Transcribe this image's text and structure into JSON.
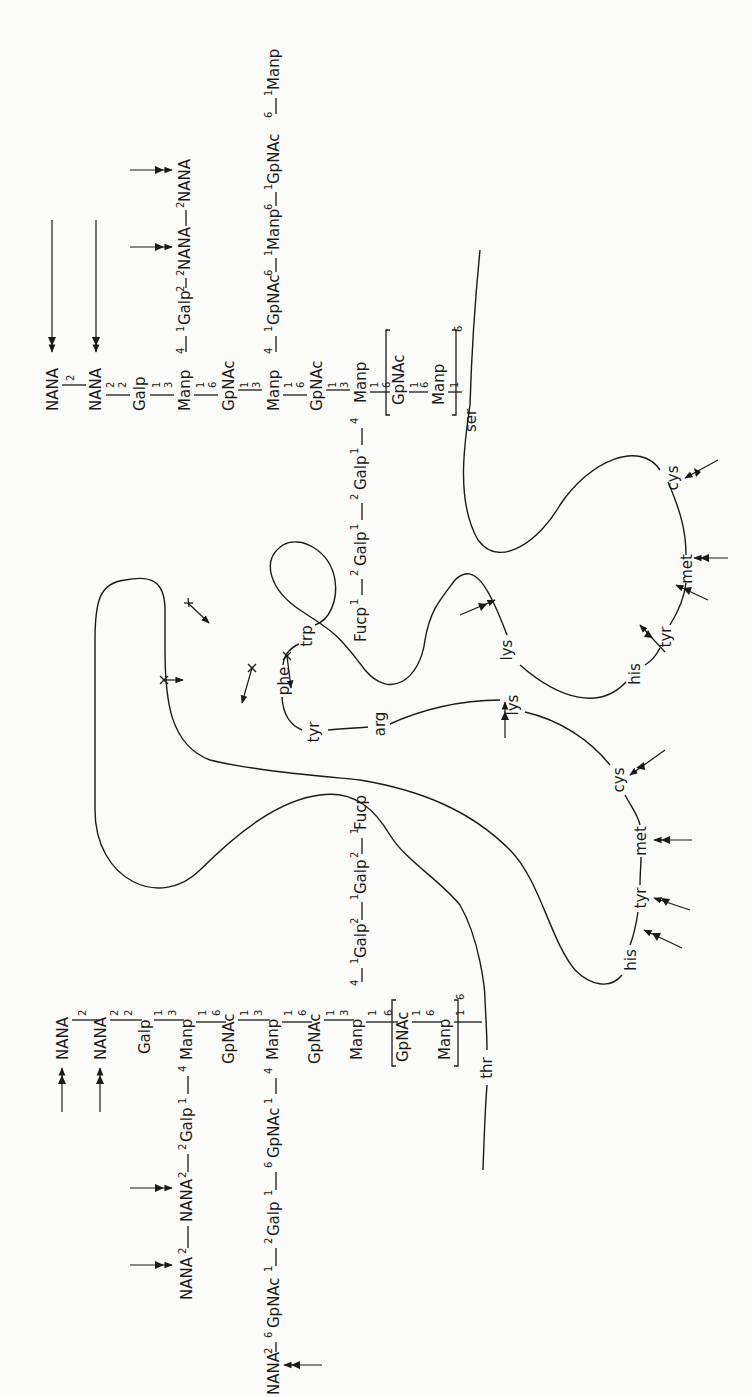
{
  "figure": {
    "orientation": "rotated-90-ccw"
  },
  "glycan_upper": {
    "attachment_residue": "ser",
    "trunk": [
      {
        "sugar": "NANA",
        "link_below": "2"
      },
      {
        "sugar": "NANA",
        "link_above": "2",
        "link_below": "2"
      },
      {
        "sugar": "Galp",
        "link_above": "2",
        "link_below": "1"
      },
      {
        "sugar": "Manp",
        "link_above": "3",
        "link_below": "1",
        "branch_pos": "4"
      },
      {
        "sugar": "GpNAc",
        "link_above": "6",
        "link_below": "1"
      },
      {
        "sugar": "Manp",
        "link_above": "3",
        "link_below": "1",
        "branch_pos": "4"
      },
      {
        "sugar": "GpNAc",
        "link_above": "6",
        "link_below": "1"
      },
      {
        "sugar": "Manp",
        "link_above": "3",
        "link_below": "1",
        "branch_pos": "4"
      },
      {
        "sugar": "GpNAc",
        "link_above": "6",
        "link_below": "1",
        "bracketed": true
      },
      {
        "sugar": "Manp",
        "link_above": "6",
        "link_below": "1",
        "bracketed": true
      },
      {
        "sugar": "ser"
      }
    ],
    "bracket_repeat": "6",
    "branches": [
      {
        "from": "Manp (1st)",
        "chain": [
          "1",
          "Galp",
          "2",
          "2",
          "NANA",
          "2",
          "NANA"
        ],
        "labels": [
          "Galp",
          "NANA",
          "NANA"
        ],
        "links": [
          "1",
          "2",
          "2",
          "2"
        ]
      },
      {
        "from": "Manp (2nd)",
        "chain": [
          "GpNAc",
          "Manp",
          "GpNAc",
          "Manp"
        ],
        "labels": [
          "GpNAc",
          "Manp",
          "GpNAc",
          "Manp"
        ],
        "links": [
          "1",
          "6",
          "1",
          "6",
          "1",
          "6",
          "1"
        ]
      },
      {
        "from": "Manp (3rd)",
        "chain": [
          "Galp",
          "Galp",
          "Fucp"
        ],
        "labels": [
          "Galp",
          "Galp",
          "Fucp"
        ],
        "links": [
          "4",
          "1",
          "2",
          "1",
          "2",
          "1"
        ]
      }
    ]
  },
  "glycan_lower": {
    "attachment_residue": "thr",
    "trunk": [
      {
        "sugar": "NANA",
        "link_below": "2"
      },
      {
        "sugar": "NANA",
        "link_above": "2",
        "link_below": "2"
      },
      {
        "sugar": "Galp",
        "link_above": "2",
        "link_below": "1"
      },
      {
        "sugar": "Manp",
        "link_above": "3",
        "link_below": "1",
        "branch_pos": "4"
      },
      {
        "sugar": "GpNAc",
        "link_above": "6",
        "link_below": "1"
      },
      {
        "sugar": "Manp",
        "link_above": "3",
        "link_below": "1",
        "branch_pos": "4"
      },
      {
        "sugar": "GpNAc",
        "link_above": "6",
        "link_below": "1"
      },
      {
        "sugar": "Manp",
        "link_above": "3",
        "link_below": "1",
        "branch_pos": "4"
      },
      {
        "sugar": "GpNAc",
        "link_above": "6",
        "link_below": "1",
        "bracketed": true
      },
      {
        "sugar": "Manp",
        "link_above": "6",
        "link_below": "1",
        "bracketed": true
      },
      {
        "sugar": "thr"
      }
    ],
    "bracket_repeat": "6",
    "branches": [
      {
        "from": "Manp (1st)",
        "labels": [
          "Galp",
          "NANA",
          "NANA"
        ],
        "links": [
          "1",
          "2",
          "2",
          "2"
        ]
      },
      {
        "from": "Manp (2nd)",
        "labels": [
          "GpNAc",
          "Galp",
          "GpNAc",
          "NANA"
        ],
        "links": [
          "1",
          "6",
          "1",
          "2",
          "1",
          "6",
          "2"
        ]
      },
      {
        "from": "Manp (3rd)",
        "labels": [
          "Galp",
          "Galp",
          "Fucp"
        ],
        "links": [
          "4",
          "1",
          "2",
          "1",
          "2",
          "1"
        ]
      }
    ]
  },
  "labels": {
    "u_nana1": "NANA",
    "u_nana2": "NANA",
    "u_galp": "Galp",
    "u_manp1": "Manp",
    "u_gpnac1": "GpNAc",
    "u_manp2": "Manp",
    "u_gpnac2": "GpNAc",
    "u_manp3": "Manp",
    "u_gpnac3": "GpNAc",
    "u_manp4": "Manp",
    "u_ser": "ser",
    "u_b1_galp": "Galp",
    "u_b1_nana1": "NANA",
    "u_b1_nana2": "NANA",
    "u_b2_gpnac1": "GpNAc",
    "u_b2_manp1": "Manp",
    "u_b2_gpnac2": "GpNAc",
    "u_b2_manp2": "Manp",
    "u_b3_galp1": "Galp",
    "u_b3_galp2": "Galp",
    "u_b3_fucp": "Fucp",
    "l_nana1": "NANA",
    "l_nana2": "NANA",
    "l_galp": "Galp",
    "l_manp1": "Manp",
    "l_gpnac1": "GpNAc",
    "l_manp2": "Manp",
    "l_gpnac2": "GpNAc",
    "l_manp3": "Manp",
    "l_gpnac3": "GpNAc",
    "l_manp4": "Manp",
    "l_thr": "thr",
    "l_b1_galp": "Galp",
    "l_b1_nana1": "NANA",
    "l_b1_nana2": "NANA",
    "l_b2_gpnac1": "GpNAc",
    "l_b2_galp": "Galp",
    "l_b2_gpnac2": "GpNAc",
    "l_b2_nana": "NANA",
    "l_b3_galp1": "Galp",
    "l_b3_galp2": "Galp",
    "l_b3_fucp": "Fucp"
  },
  "link_numbers": {
    "one": "1",
    "two": "2",
    "three": "3",
    "four": "4",
    "six": "6"
  },
  "amino_acids": {
    "phe": "phe",
    "trp": "trp",
    "tyr_inner": "tyr",
    "arg": "arg",
    "lys_center": "lys",
    "lys_upper": "lys",
    "cys_upper": "cys",
    "met_upper": "met",
    "tyr_upper": "tyr",
    "his_upper": "his",
    "cys_lower": "cys",
    "met_lower": "met",
    "tyr_lower": "tyr",
    "his_lower": "his",
    "ser": "ser",
    "thr": "thr"
  },
  "markers": {
    "double_arrow": "cleavage site (enzyme)",
    "crossed_arrow": "blocked / resistant site"
  }
}
